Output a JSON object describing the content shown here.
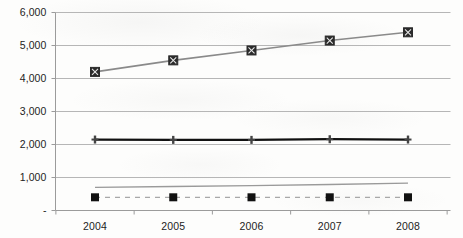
{
  "chart_data": {
    "type": "line",
    "title": "",
    "subtitle": "",
    "xlabel": "",
    "ylabel": "",
    "categories": [
      "2004",
      "2005",
      "2006",
      "2007",
      "2008"
    ],
    "x": [
      2004,
      2005,
      2006,
      2007,
      2008
    ],
    "ylim": [
      0,
      6000
    ],
    "xlim": [
      2003.5,
      2008.5
    ],
    "y_ticks": [
      0,
      1000,
      2000,
      3000,
      4000,
      5000,
      6000
    ],
    "y_tick_labels": [
      "-",
      "1,000",
      "2,000",
      "3,000",
      "4,000",
      "5,000",
      "6,000"
    ],
    "x_tick_labels": [
      "2004",
      "2005",
      "2006",
      "2007",
      "2008"
    ],
    "grid": "horizontal",
    "legend": "none",
    "series": [
      {
        "name": "series-1",
        "values": [
          4200,
          4550,
          4850,
          5150,
          5400
        ],
        "color": "#8a8a8a",
        "marker": "square-x",
        "marker_color": "#2b2b2b",
        "line_style": "solid",
        "line_width": 1.6
      },
      {
        "name": "series-2",
        "values": [
          2150,
          2140,
          2140,
          2160,
          2150
        ],
        "color": "#111111",
        "marker": "cross",
        "marker_color": "#444444",
        "line_style": "solid",
        "line_width": 2.2
      },
      {
        "name": "series-3",
        "values": [
          700,
          725,
          755,
          790,
          830
        ],
        "color": "#9a9a9a",
        "marker": "none",
        "marker_color": "#9a9a9a",
        "line_style": "solid",
        "line_width": 1.4
      },
      {
        "name": "series-4",
        "values": [
          400,
          400,
          400,
          400,
          400
        ],
        "color": "#a8a8a8",
        "marker": "square",
        "marker_color": "#111111",
        "line_style": "dashed",
        "line_width": 1.2
      }
    ]
  },
  "axis": {
    "axis_line_color": "#9b9b9b",
    "grid_color": "#b6b6b6"
  }
}
